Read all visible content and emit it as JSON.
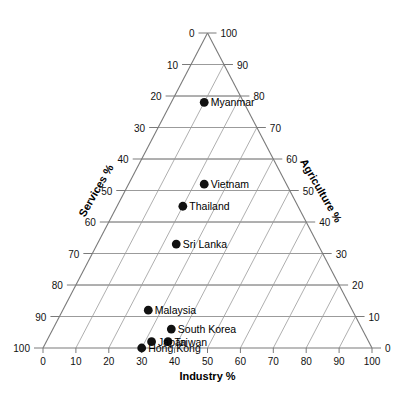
{
  "chart_data": {
    "type": "scatter",
    "plot_kind": "ternary",
    "title": "",
    "axes": {
      "bottom": {
        "label": "Industry %",
        "ticks": [
          0,
          10,
          20,
          30,
          40,
          50,
          60,
          70,
          80,
          90,
          100
        ]
      },
      "left": {
        "label": "Services %",
        "ticks": [
          0,
          10,
          20,
          30,
          40,
          50,
          60,
          70,
          80,
          90,
          100
        ]
      },
      "right": {
        "label": "Agriculture %",
        "ticks": [
          0,
          10,
          20,
          30,
          40,
          50,
          60,
          70,
          80,
          90,
          100
        ]
      }
    },
    "grid": true,
    "legend": "none",
    "components": [
      "Industry %",
      "Services %",
      "Agriculture %"
    ],
    "points": [
      {
        "name": "Myanmar",
        "industry": 10,
        "services": 12,
        "agriculture": 78
      },
      {
        "name": "Vietnam",
        "industry": 23,
        "services": 25,
        "agriculture": 52
      },
      {
        "name": "Thailand",
        "industry": 20,
        "services": 35,
        "agriculture": 45
      },
      {
        "name": "Sri Lanka",
        "industry": 24,
        "services": 43,
        "agriculture": 33
      },
      {
        "name": "Malaysia",
        "industry": 26,
        "services": 62,
        "agriculture": 12
      },
      {
        "name": "South Korea",
        "industry": 36,
        "services": 58,
        "agriculture": 6
      },
      {
        "name": "Taiwan",
        "industry": 37,
        "services": 61,
        "agriculture": 2
      },
      {
        "name": "Japan",
        "industry": 32,
        "services": 66,
        "agriculture": 2
      },
      {
        "name": "Hong Kong",
        "industry": 30,
        "services": 70,
        "agriculture": 0
      }
    ]
  },
  "colors": {
    "marker": "#111111",
    "grid": "#9a9a9a",
    "axis": "#7a7a7a",
    "text": "#000000"
  }
}
